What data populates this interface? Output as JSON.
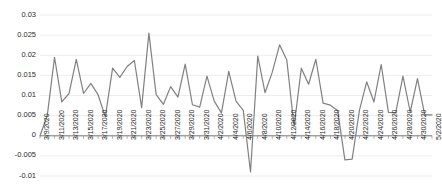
{
  "chart_data": {
    "type": "line",
    "title": "",
    "xlabel": "",
    "ylabel": "",
    "grid": true,
    "legend": "none",
    "ylim": [
      -0.01,
      0.03
    ],
    "ytick_labels": [
      "0.03",
      "0.025",
      "0.02",
      "0.015",
      "0.01",
      "0.005",
      "0",
      "-0.005",
      "-0.01"
    ],
    "ytick_values": [
      0.03,
      0.025,
      0.02,
      0.015,
      0.01,
      0.005,
      0,
      -0.005,
      -0.01
    ],
    "xtick_labels": [
      "3/9/2020",
      "3/11/2020",
      "3/13/2020",
      "3/15/2020",
      "3/17/2020",
      "3/19/2020",
      "3/21/2020",
      "3/23/2020",
      "3/25/2020",
      "3/27/2020",
      "3/29/2020",
      "3/31/2020",
      "4/2/2020",
      "4/4/2020",
      "4/6/2020",
      "4/8/2020",
      "4/10/2020",
      "4/12/2020",
      "4/14/2020",
      "4/16/2020",
      "4/18/2020",
      "4/20/2020",
      "4/22/2020",
      "4/24/2020",
      "4/26/2020",
      "4/28/2020",
      "4/30/2020",
      "5/2/2020"
    ],
    "categories": [
      "3/9/2020",
      "3/10/2020",
      "3/11/2020",
      "3/12/2020",
      "3/13/2020",
      "3/14/2020",
      "3/15/2020",
      "3/16/2020",
      "3/17/2020",
      "3/18/2020",
      "3/19/2020",
      "3/20/2020",
      "3/21/2020",
      "3/22/2020",
      "3/23/2020",
      "3/24/2020",
      "3/25/2020",
      "3/26/2020",
      "3/27/2020",
      "3/28/2020",
      "3/29/2020",
      "3/30/2020",
      "3/31/2020",
      "4/1/2020",
      "4/2/2020",
      "4/3/2020",
      "4/4/2020",
      "4/5/2020",
      "4/6/2020",
      "4/7/2020",
      "4/8/2020",
      "4/9/2020",
      "4/10/2020",
      "4/11/2020",
      "4/12/2020",
      "4/13/2020",
      "4/14/2020",
      "4/15/2020",
      "4/16/2020",
      "4/17/2020",
      "4/18/2020",
      "4/19/2020",
      "4/20/2020",
      "4/21/2020",
      "4/22/2020",
      "4/23/2020",
      "4/24/2020",
      "4/25/2020",
      "4/26/2020",
      "4/27/2020",
      "4/28/2020",
      "4/29/2020",
      "4/30/2020",
      "5/1/2020",
      "5/2/2020"
    ],
    "series": [
      {
        "name": "series-1",
        "color": "#808080",
        "values": [
          0.0,
          0.005,
          0.0195,
          0.0084,
          0.0105,
          0.019,
          0.0105,
          0.013,
          0.0102,
          0.0047,
          0.0168,
          0.0145,
          0.0172,
          0.0187,
          0.007,
          0.0255,
          0.0102,
          0.0078,
          0.0122,
          0.0096,
          0.0178,
          0.0077,
          0.0071,
          0.0148,
          0.0086,
          0.0057,
          0.016,
          0.0086,
          0.0063,
          -0.009,
          0.0198,
          0.0107,
          0.0158,
          0.0226,
          0.0188,
          0.0023,
          0.0168,
          0.0128,
          0.019,
          0.0081,
          0.0076,
          0.0063,
          -0.006,
          -0.0058,
          0.0063,
          0.0134,
          0.0084,
          0.0177,
          0.0058,
          0.0057,
          0.0148,
          0.0059,
          0.0142,
          0.0052,
          0.0052
        ]
      }
    ]
  },
  "axis": {
    "zero_line_label": "0"
  }
}
